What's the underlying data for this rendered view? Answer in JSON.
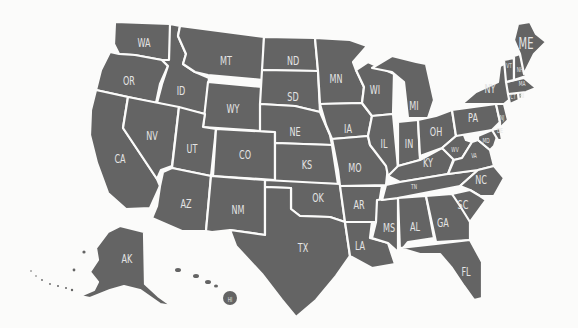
{
  "map": {
    "title": "United States map with state abbreviations",
    "colors": {
      "land": "#646464",
      "border": "#fbfbfa",
      "label": "#e4e4e4",
      "background": "#fbfbfa"
    },
    "states": [
      {
        "abbr": "WA",
        "x": 144,
        "y": 42,
        "size": "md"
      },
      {
        "abbr": "OR",
        "x": 129,
        "y": 80,
        "size": "md"
      },
      {
        "abbr": "CA",
        "x": 120,
        "y": 158,
        "size": "md"
      },
      {
        "abbr": "ID",
        "x": 181,
        "y": 90,
        "size": "md"
      },
      {
        "abbr": "NV",
        "x": 152,
        "y": 135,
        "size": "md"
      },
      {
        "abbr": "MT",
        "x": 226,
        "y": 60,
        "size": "md"
      },
      {
        "abbr": "WY",
        "x": 233,
        "y": 108,
        "size": "md"
      },
      {
        "abbr": "UT",
        "x": 192,
        "y": 148,
        "size": "md"
      },
      {
        "abbr": "CO",
        "x": 245,
        "y": 154,
        "size": "md"
      },
      {
        "abbr": "AZ",
        "x": 186,
        "y": 203,
        "size": "md"
      },
      {
        "abbr": "NM",
        "x": 238,
        "y": 209,
        "size": "md"
      },
      {
        "abbr": "ND",
        "x": 293,
        "y": 60,
        "size": "md"
      },
      {
        "abbr": "SD",
        "x": 293,
        "y": 96,
        "size": "md"
      },
      {
        "abbr": "NE",
        "x": 295,
        "y": 131,
        "size": "md"
      },
      {
        "abbr": "KS",
        "x": 307,
        "y": 164,
        "size": "md"
      },
      {
        "abbr": "OK",
        "x": 318,
        "y": 197,
        "size": "md"
      },
      {
        "abbr": "TX",
        "x": 303,
        "y": 247,
        "size": "md"
      },
      {
        "abbr": "MN",
        "x": 336,
        "y": 78,
        "size": "md"
      },
      {
        "abbr": "IA",
        "x": 348,
        "y": 128,
        "size": "md"
      },
      {
        "abbr": "MO",
        "x": 355,
        "y": 167,
        "size": "md"
      },
      {
        "abbr": "AR",
        "x": 359,
        "y": 204,
        "size": "md"
      },
      {
        "abbr": "LA",
        "x": 360,
        "y": 245,
        "size": "md"
      },
      {
        "abbr": "WI",
        "x": 375,
        "y": 89,
        "size": "md"
      },
      {
        "abbr": "IL",
        "x": 384,
        "y": 143,
        "size": "md"
      },
      {
        "abbr": "MS",
        "x": 389,
        "y": 227,
        "size": "md"
      },
      {
        "abbr": "MI",
        "x": 414,
        "y": 105,
        "size": "md"
      },
      {
        "abbr": "IN",
        "x": 409,
        "y": 143,
        "size": "md"
      },
      {
        "abbr": "KY",
        "x": 428,
        "y": 162,
        "size": "md"
      },
      {
        "abbr": "TN",
        "x": 414,
        "y": 187,
        "size": "sm"
      },
      {
        "abbr": "AL",
        "x": 415,
        "y": 226,
        "size": "md"
      },
      {
        "abbr": "OH",
        "x": 436,
        "y": 131,
        "size": "md"
      },
      {
        "abbr": "GA",
        "x": 443,
        "y": 222,
        "size": "md"
      },
      {
        "abbr": "FL",
        "x": 466,
        "y": 271,
        "size": "md"
      },
      {
        "abbr": "WV",
        "x": 455,
        "y": 150,
        "size": "sm"
      },
      {
        "abbr": "VA",
        "x": 474,
        "y": 156,
        "size": "sm"
      },
      {
        "abbr": "NC",
        "x": 481,
        "y": 179,
        "size": "md"
      },
      {
        "abbr": "SC",
        "x": 463,
        "y": 204,
        "size": "md"
      },
      {
        "abbr": "PA",
        "x": 473,
        "y": 117,
        "size": "md"
      },
      {
        "abbr": "NY",
        "x": 490,
        "y": 88,
        "size": "md"
      },
      {
        "abbr": "MD",
        "x": 486,
        "y": 141,
        "size": "sm"
      },
      {
        "abbr": "DE",
        "x": 500,
        "y": 131,
        "size": "sm"
      },
      {
        "abbr": "NJ",
        "x": 502,
        "y": 118,
        "size": "sm"
      },
      {
        "abbr": "CT",
        "x": 513,
        "y": 97,
        "size": "sm"
      },
      {
        "abbr": "RI",
        "x": 522,
        "y": 96,
        "size": "sm"
      },
      {
        "abbr": "MA",
        "x": 522,
        "y": 84,
        "size": "sm"
      },
      {
        "abbr": "VT",
        "x": 509,
        "y": 66,
        "size": "sm"
      },
      {
        "abbr": "NH",
        "x": 520,
        "y": 70,
        "size": "sm"
      },
      {
        "abbr": "ME",
        "x": 526,
        "y": 44,
        "size": "lg"
      },
      {
        "abbr": "AK",
        "x": 127,
        "y": 258,
        "size": "md"
      },
      {
        "abbr": "HI",
        "x": 230,
        "y": 300,
        "size": "sm"
      }
    ]
  }
}
